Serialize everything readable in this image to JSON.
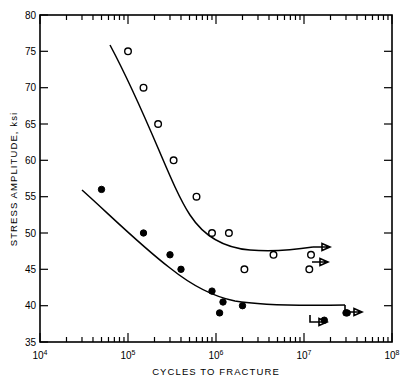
{
  "chart": {
    "title": "",
    "xlabel": "CYCLES TO FRACTURE",
    "ylabel": "STRESS AMPLITUDE, ksi",
    "y_ticks": [
      "35",
      "40",
      "45",
      "50",
      "55",
      "60",
      "65",
      "70",
      "75",
      "80"
    ],
    "x_ticks": [
      {
        "mantissa": "10",
        "exp": "4"
      },
      {
        "mantissa": "10",
        "exp": "5"
      },
      {
        "mantissa": "10",
        "exp": "6"
      },
      {
        "mantissa": "10",
        "exp": "7"
      },
      {
        "mantissa": "10",
        "exp": "8"
      }
    ]
  },
  "chart_data": {
    "type": "scatter",
    "title": "",
    "xlabel": "CYCLES TO FRACTURE",
    "ylabel": "STRESS AMPLITUDE, ksi",
    "xscale": "log",
    "yscale": "linear",
    "xlim": [
      10000,
      100000000
    ],
    "ylim": [
      35,
      80
    ],
    "grid": false,
    "legend": "none",
    "yticks": [
      35,
      40,
      45,
      50,
      55,
      60,
      65,
      70,
      75,
      80
    ],
    "xticks": [
      10000,
      100000,
      1000000,
      10000000,
      100000000
    ],
    "series": [
      {
        "name": "open-circle series",
        "marker": "open circle",
        "points": [
          {
            "x": 100000,
            "y": 75
          },
          {
            "x": 150000,
            "y": 70
          },
          {
            "x": 220000,
            "y": 65
          },
          {
            "x": 330000,
            "y": 60
          },
          {
            "x": 600000,
            "y": 55
          },
          {
            "x": 900000,
            "y": 50
          },
          {
            "x": 1400000,
            "y": 50
          },
          {
            "x": 2100000,
            "y": 45
          },
          {
            "x": 4500000,
            "y": 47
          },
          {
            "x": 12000000,
            "y": 47,
            "runout": true
          },
          {
            "x": 11500000,
            "y": 45,
            "runout": true
          }
        ]
      },
      {
        "name": "filled-circle series",
        "marker": "filled circle",
        "points": [
          {
            "x": 50000,
            "y": 56
          },
          {
            "x": 150000,
            "y": 50
          },
          {
            "x": 300000,
            "y": 47
          },
          {
            "x": 400000,
            "y": 45
          },
          {
            "x": 900000,
            "y": 42
          },
          {
            "x": 1200000,
            "y": 40.5
          },
          {
            "x": 1100000,
            "y": 39
          },
          {
            "x": 2000000,
            "y": 40
          },
          {
            "x": 30000000,
            "y": 39
          },
          {
            "x": 17000000,
            "y": 38,
            "runout": true
          },
          {
            "x": 31000000,
            "y": 39,
            "runout": true
          }
        ]
      }
    ]
  }
}
